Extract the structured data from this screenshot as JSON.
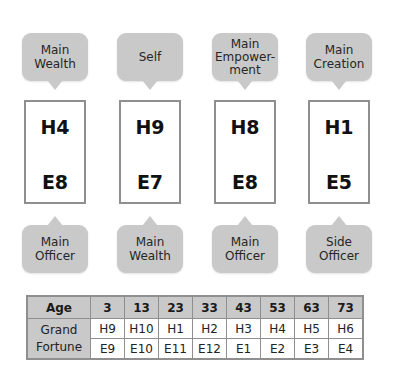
{
  "columns": [
    {
      "top_label": "Main\nWealth",
      "top_lines": [
        "Main",
        "Wealth"
      ],
      "house": "H4",
      "element": "E8",
      "bottom_lines": [
        "Main",
        "Officer"
      ]
    },
    {
      "top_lines": [
        "Self"
      ],
      "house": "H9",
      "element": "E7",
      "bottom_lines": [
        "Main",
        "Wealth"
      ]
    },
    {
      "top_lines": [
        "Main",
        "Empower-",
        "ment"
      ],
      "house": "H8",
      "element": "E8",
      "bottom_lines": [
        "Main",
        "Officer"
      ]
    },
    {
      "top_lines": [
        "Main",
        "Creation"
      ],
      "house": "H1",
      "element": "E5",
      "bottom_lines": [
        "Side",
        "Officer"
      ]
    }
  ],
  "table": {
    "age_header": "Age",
    "ages": [
      "3",
      "13",
      "23",
      "33",
      "43",
      "53",
      "63",
      "73"
    ],
    "row_label_lines": [
      "Grand",
      "Fortune"
    ],
    "houses": [
      "H9",
      "H10",
      "H1",
      "H2",
      "H3",
      "H4",
      "H5",
      "H6"
    ],
    "elements": [
      "E9",
      "E10",
      "E11",
      "E12",
      "E1",
      "E2",
      "E3",
      "E4"
    ]
  },
  "colors": {
    "bubble_fill": "#c9c9c9",
    "box_border": "#8f8f8f",
    "table_header_fill": "#c9c9c9"
  }
}
